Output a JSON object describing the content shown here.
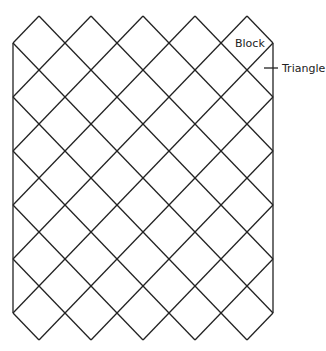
{
  "diagram": {
    "labels": {
      "block": "Block",
      "triangle": "Triangle"
    },
    "grid": {
      "columns": 5,
      "rows": 6,
      "left": 13,
      "right": 273,
      "top": 16,
      "bottom": 340,
      "half_width": 26,
      "half_height": 27
    },
    "line_color": "#222222"
  }
}
